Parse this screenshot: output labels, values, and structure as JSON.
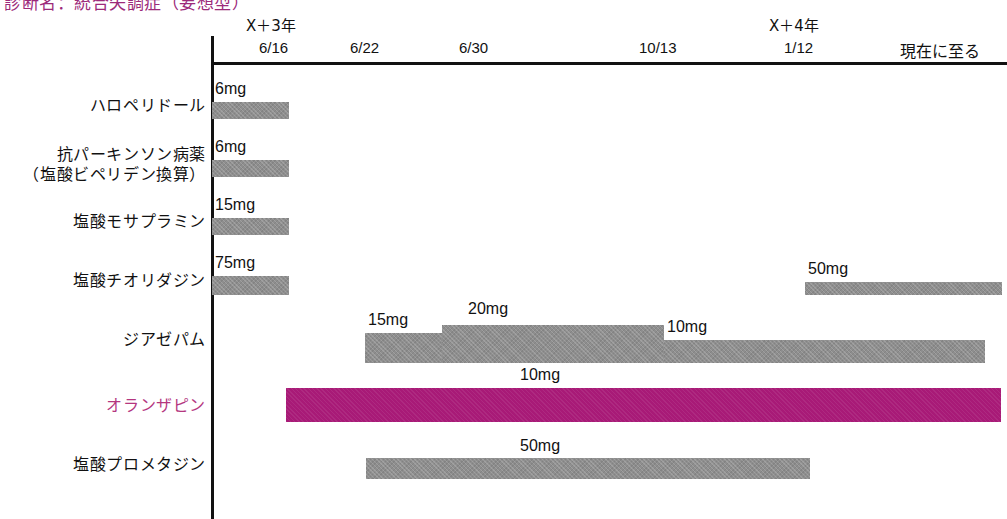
{
  "chart_data": {
    "type": "bar",
    "title": "診断名：統合失調症（妄想型）",
    "subtitle": "",
    "xlabel": "",
    "ylabel": "",
    "orientation": "horizontal",
    "grid": false,
    "legend": "none",
    "x_axis": {
      "ticks": [
        {
          "label": "6/16",
          "year_label": "X＋3年",
          "x": 285
        },
        {
          "label": "6/22",
          "year_label": "",
          "x": 370
        },
        {
          "label": "6/30",
          "year_label": "",
          "x": 480
        },
        {
          "label": "10/13",
          "year_label": "",
          "x": 665
        },
        {
          "label": "1/12",
          "year_label": "X＋4年",
          "x": 805
        }
      ],
      "end_note": "現在に至る"
    },
    "categories": [
      "ハロペリドール",
      "抗パーキンソン病薬（塩酸ビペリデン換算）",
      "塩酸モサプラミン",
      "塩酸チオリダジン",
      "ジアゼパム",
      "オランザピン",
      "塩酸プロメタジン"
    ],
    "rows": [
      {
        "name": "ハロペリドール",
        "label_lines": [
          "ハロペリドール"
        ],
        "accent": false,
        "segments": [
          {
            "dose": "6mg",
            "dose_value": 6,
            "start": "6/16",
            "end": "6/22",
            "x": 212,
            "width": 77,
            "y": 102,
            "height": 17,
            "label_x": 215,
            "label_y": 80
          }
        ]
      },
      {
        "name": "抗パーキンソン病薬（塩酸ビペリデン換算）",
        "label_lines": [
          "抗パーキンソン病薬",
          "（塩酸ビペリデン換算）"
        ],
        "accent": false,
        "segments": [
          {
            "dose": "6mg",
            "dose_value": 6,
            "start": "6/16",
            "end": "6/22",
            "x": 212,
            "width": 77,
            "y": 160,
            "height": 17,
            "label_x": 215,
            "label_y": 138
          }
        ]
      },
      {
        "name": "塩酸モサプラミン",
        "label_lines": [
          "塩酸モサプラミン"
        ],
        "accent": false,
        "segments": [
          {
            "dose": "15mg",
            "dose_value": 15,
            "start": "6/16",
            "end": "6/22",
            "x": 212,
            "width": 77,
            "y": 218,
            "height": 17,
            "label_x": 215,
            "label_y": 196
          }
        ]
      },
      {
        "name": "塩酸チオリダジン",
        "label_lines": [
          "塩酸チオリダジン"
        ],
        "accent": false,
        "segments": [
          {
            "dose": "75mg",
            "dose_value": 75,
            "start": "6/16",
            "end": "6/22",
            "x": 212,
            "width": 77,
            "y": 276,
            "height": 19,
            "label_x": 215,
            "label_y": 254
          },
          {
            "dose": "50mg",
            "dose_value": 50,
            "start": "1/12",
            "end": "現在に至る",
            "x": 805,
            "width": 197,
            "y": 282,
            "height": 13,
            "label_x": 808,
            "label_y": 260
          }
        ]
      },
      {
        "name": "ジアゼパム",
        "label_lines": [
          "ジアゼパム"
        ],
        "accent": false,
        "segments": [
          {
            "dose": "15mg",
            "dose_value": 15,
            "start": "6/22",
            "end": "6/30",
            "x": 365,
            "width": 77,
            "y": 333,
            "height": 30,
            "label_x": 368,
            "label_y": 311
          },
          {
            "dose": "20mg",
            "dose_value": 20,
            "start": "6/30",
            "end": "10/13",
            "x": 442,
            "width": 222,
            "y": 325,
            "height": 38,
            "label_x": 468,
            "label_y": 300
          },
          {
            "dose": "10mg",
            "dose_value": 10,
            "start": "10/13",
            "end": "現在に至る",
            "x": 664,
            "width": 321,
            "y": 340,
            "height": 23,
            "label_x": 667,
            "label_y": 318
          }
        ]
      },
      {
        "name": "オランザピン",
        "label_lines": [
          "オランザピン"
        ],
        "accent": true,
        "segments": [
          {
            "dose": "10mg",
            "dose_value": 10,
            "start": "6/16",
            "end": "現在に至る",
            "x": 286,
            "width": 715,
            "y": 388,
            "height": 34,
            "label_x": 520,
            "label_y": 366
          }
        ]
      },
      {
        "name": "塩酸プロメタジン",
        "label_lines": [
          "塩酸プロメタジン"
        ],
        "accent": false,
        "segments": [
          {
            "dose": "50mg",
            "dose_value": 50,
            "start": "6/22",
            "end": "1/12",
            "x": 366,
            "width": 444,
            "y": 458,
            "height": 21,
            "label_x": 520,
            "label_y": 437
          }
        ]
      }
    ]
  },
  "title": {
    "text": "診断名：統合失調症（妄想型）"
  },
  "axis": {
    "end_note": "現在に至る",
    "year_3": "X＋3年",
    "year_4": "X＋4年",
    "d1": "6/16",
    "d2": "6/22",
    "d3": "6/30",
    "d4": "10/13",
    "d5": "1/12"
  },
  "rows": {
    "r0_l0": "ハロペリドール",
    "r1_l0": "抗パーキンソン病薬",
    "r1_l1": "（塩酸ビペリデン換算）",
    "r2_l0": "塩酸モサプラミン",
    "r3_l0": "塩酸チオリダジン",
    "r4_l0": "ジアゼパム",
    "r5_l0": "オランザピン",
    "r6_l0": "塩酸プロメタジン"
  },
  "doses": {
    "haloperidol": "6mg",
    "antiparkinson": "6mg",
    "mosapramine": "15mg",
    "thioridazine_1": "75mg",
    "thioridazine_2": "50mg",
    "diazepam_1": "15mg",
    "diazepam_2": "20mg",
    "diazepam_3": "10mg",
    "olanzapine": "10mg",
    "promethazine": "50mg"
  },
  "colors": {
    "accent": "#a81a77",
    "accent_text": "#b4367f",
    "bar_gray": "#8e8e8e",
    "axis": "#111111"
  }
}
